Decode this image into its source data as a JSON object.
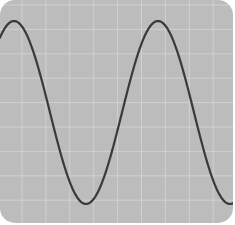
{
  "chart_data": {
    "type": "line",
    "title": "",
    "xlabel": "",
    "ylabel": "",
    "grid": true,
    "legend": null,
    "series": [
      {
        "name": "sine wave",
        "function": "sine",
        "points_px": [
          [
            0,
            35
          ],
          [
            14,
            20
          ],
          [
            85,
            204
          ],
          [
            158,
            22
          ],
          [
            228,
            205
          ],
          [
            233,
            203
          ]
        ]
      }
    ],
    "wave": {
      "period_px": 144,
      "first_peak_x": 14,
      "peak_y": 21,
      "trough_y": 204
    },
    "grid_spacing_px": {
      "x": 23.9,
      "y": 24.4
    },
    "grid_offset_px": {
      "x": 22,
      "y": 5
    }
  },
  "colors": {
    "background": "#bcbcbc",
    "grid": "#d1d1d1",
    "curve": "#3a3a3a",
    "page": "#ffffff"
  }
}
